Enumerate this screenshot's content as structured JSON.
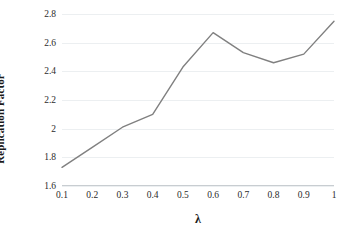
{
  "chart_data": {
    "type": "line",
    "title": "",
    "xlabel": "λ",
    "ylabel": "Replication Factor",
    "categories": [
      "0.1",
      "0.2",
      "0.3",
      "0.4",
      "0.5",
      "0.6",
      "0.7",
      "0.8",
      "0.9",
      "1"
    ],
    "x": [
      0.1,
      0.2,
      0.3,
      0.4,
      0.5,
      0.6,
      0.7,
      0.8,
      0.9,
      1.0
    ],
    "values": [
      1.73,
      1.87,
      2.01,
      2.1,
      2.43,
      2.67,
      2.53,
      2.46,
      2.52,
      2.75
    ],
    "series": [
      {
        "name": "Replication Factor",
        "values": [
          1.73,
          1.87,
          2.01,
          2.1,
          2.43,
          2.67,
          2.53,
          2.46,
          2.52,
          2.75
        ],
        "color": "#808080"
      }
    ],
    "ylim": [
      1.6,
      2.8
    ],
    "xlim": [
      0.1,
      1.0
    ],
    "yticks": [
      "1.6",
      "1.8",
      "2",
      "2.2",
      "2.4",
      "2.6",
      "2.8"
    ],
    "ytick_values": [
      1.6,
      1.8,
      2.0,
      2.2,
      2.4,
      2.6,
      2.8
    ],
    "xticks": [
      "0.1",
      "0.2",
      "0.3",
      "0.4",
      "0.5",
      "0.6",
      "0.7",
      "0.8",
      "0.9",
      "1"
    ],
    "grid": "horizontal",
    "legend": "none",
    "line_color": "#808080",
    "gridline_color": "#eceff1",
    "axis_color": "#c8cdd1",
    "background": "#ffffff",
    "markers": "none"
  }
}
